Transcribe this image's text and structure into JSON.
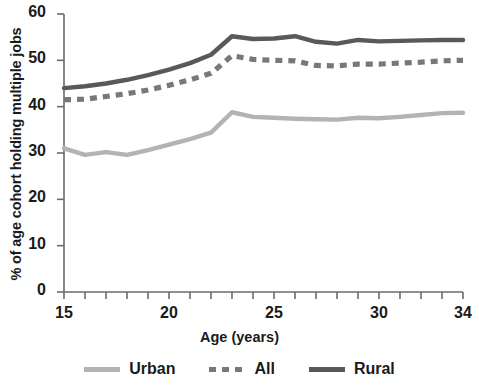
{
  "chart_data": {
    "type": "line",
    "title": "",
    "xlabel": "Age (years)",
    "ylabel": "% of age cohort holding multiple jobs",
    "xlim": [
      15,
      34
    ],
    "ylim": [
      0,
      60
    ],
    "xticks": [
      15,
      16,
      17,
      18,
      19,
      20,
      21,
      22,
      23,
      24,
      25,
      26,
      27,
      28,
      29,
      30,
      31,
      32,
      33,
      34
    ],
    "xtick_labels": [
      {
        "value": 15,
        "label": "15"
      },
      {
        "value": 20,
        "label": "20"
      },
      {
        "value": 25,
        "label": "25"
      },
      {
        "value": 30,
        "label": "30"
      },
      {
        "value": 34,
        "label": "34"
      }
    ],
    "yticks": [
      0,
      10,
      20,
      30,
      40,
      50,
      60
    ],
    "ytick_labels": [
      "0",
      "10",
      "20",
      "30",
      "40",
      "50",
      "60"
    ],
    "grid": false,
    "legend_position": "bottom",
    "x": [
      15,
      16,
      17,
      18,
      19,
      20,
      21,
      22,
      23,
      24,
      25,
      26,
      27,
      28,
      29,
      30,
      31,
      32,
      33,
      34
    ],
    "series": [
      {
        "name": "Urban",
        "style": "solid",
        "color": "#b3b3b3",
        "values": [
          31.0,
          29.6,
          30.2,
          29.6,
          30.6,
          31.8,
          33.0,
          34.4,
          38.8,
          37.8,
          37.6,
          37.4,
          37.3,
          37.2,
          37.6,
          37.5,
          37.8,
          38.2,
          38.6,
          38.7
        ]
      },
      {
        "name": "All",
        "style": "dashed",
        "color": "#787878",
        "values": [
          41.5,
          41.6,
          42.2,
          42.8,
          43.6,
          44.6,
          45.8,
          47.2,
          51.0,
          50.2,
          50.0,
          49.9,
          48.9,
          48.8,
          49.2,
          49.2,
          49.4,
          49.6,
          49.9,
          50.0
        ]
      },
      {
        "name": "Rural",
        "style": "solid",
        "color": "#595959",
        "values": [
          44.0,
          44.4,
          45.0,
          45.8,
          46.8,
          48.0,
          49.4,
          51.2,
          55.2,
          54.6,
          54.7,
          55.2,
          54.0,
          53.6,
          54.4,
          54.1,
          54.2,
          54.3,
          54.4,
          54.4
        ]
      }
    ]
  },
  "axis": {
    "color": "#6b6b6b"
  }
}
